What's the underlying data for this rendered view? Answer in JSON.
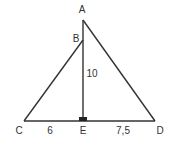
{
  "diagram": {
    "type": "geometry-figure",
    "stroke_color": "#333333",
    "points": {
      "A": {
        "label": "A",
        "x": 83,
        "y": 20
      },
      "B": {
        "label": "B",
        "x": 83,
        "y": 40
      },
      "C": {
        "label": "C",
        "x": 24,
        "y": 121
      },
      "D": {
        "label": "D",
        "x": 155,
        "y": 121
      },
      "E": {
        "label": "E",
        "x": 83,
        "y": 121
      }
    },
    "segments": [
      "A-D",
      "B-C",
      "A-E",
      "C-D"
    ],
    "measurements": {
      "CE": "6",
      "ED": "7,5",
      "BE": "10"
    },
    "right_angle_at": "E"
  }
}
